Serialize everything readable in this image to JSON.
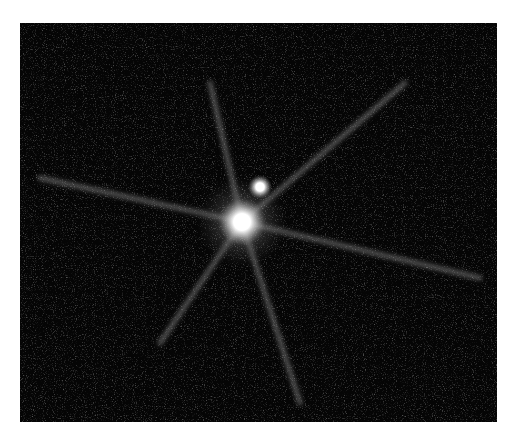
{
  "image": {
    "subject": "bright star with faint companion and diffraction spikes",
    "background_color": "#050505",
    "border_color": "#ffffff",
    "primary_star": {
      "cx": 222,
      "cy": 199,
      "r": 14
    },
    "companion_star": {
      "cx": 240,
      "cy": 164,
      "r": 7
    },
    "spike_angles_deg": [
      -62,
      -20,
      15,
      58,
      110,
      155,
      200,
      245
    ]
  }
}
